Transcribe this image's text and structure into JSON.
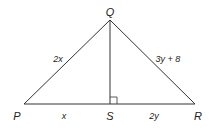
{
  "diagram": {
    "vertices": {
      "Q": {
        "label": "Q",
        "x": 110,
        "y": 20
      },
      "P": {
        "label": "P",
        "x": 24,
        "y": 104
      },
      "R": {
        "label": "R",
        "x": 195,
        "y": 104
      },
      "S": {
        "label": "S",
        "x": 110,
        "y": 104
      }
    },
    "segments": {
      "PQ": {
        "label": "2x"
      },
      "QR": {
        "label": "3y + 8"
      },
      "PS": {
        "label": "x"
      },
      "SR": {
        "label": "2y"
      }
    },
    "right_angle_at": "S",
    "line_color": "#333333"
  }
}
